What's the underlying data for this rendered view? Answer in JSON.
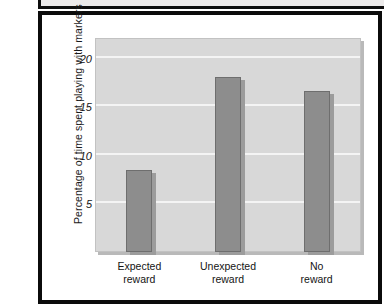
{
  "figure": {
    "y_axis_title": "Percentage of time spent playing with markers"
  },
  "chart_data": {
    "type": "bar",
    "title": "",
    "xlabel": "",
    "ylabel": "Percentage of time spent playing with markers",
    "categories": [
      "Expected reward",
      "Unexpected reward",
      "No reward"
    ],
    "category_lines": [
      [
        "Expected",
        "reward"
      ],
      [
        "Unexpected",
        "reward"
      ],
      [
        "No",
        "reward"
      ]
    ],
    "values": [
      8.5,
      18.2,
      16.7
    ],
    "ylim": [
      0,
      22.2
    ],
    "yticks": [
      5,
      10,
      15,
      20
    ],
    "ytick_labels": [
      "5",
      "10",
      "15",
      "20"
    ],
    "grid": true,
    "legend": "none",
    "colors": {
      "bar_fill": "#8d8d8d",
      "bar_edge": "#6e6e6e",
      "panel_background": "#d8d8d8",
      "gridline": "#f4f4f4",
      "frame": "#0b0b0b",
      "text": "#141414"
    }
  }
}
